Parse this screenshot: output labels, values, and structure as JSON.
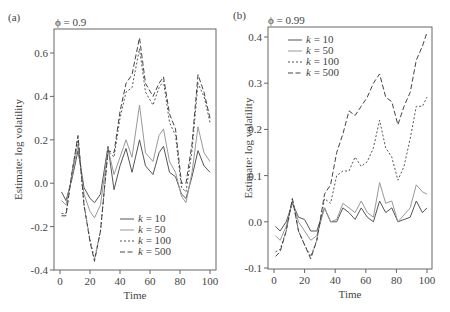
{
  "chart_data": [
    {
      "type": "line",
      "panel_label": "(a)",
      "title": "ϕ = 0.9",
      "xlabel": "Time",
      "ylabel": "Estimate: log volatility",
      "xlim": [
        0,
        100
      ],
      "ylim": [
        -0.4,
        0.7
      ],
      "xticks": [
        0,
        20,
        40,
        60,
        80,
        100
      ],
      "yticks": [
        -0.4,
        -0.2,
        0.0,
        0.2,
        0.4,
        0.6
      ],
      "ytick_labels": [
        "-0.4",
        "-0.2",
        "0.0",
        "0.2",
        "0.4",
        "0.6"
      ],
      "legend_position": "lower center",
      "x": [
        1,
        4,
        8,
        12,
        16,
        20,
        23,
        27,
        32,
        36,
        40,
        44,
        48,
        53,
        57,
        62,
        66,
        69,
        73,
        77,
        81,
        84,
        88,
        92,
        96,
        100
      ],
      "series": [
        {
          "name": "k = 10",
          "style": "solid",
          "values": [
            -0.04,
            -0.08,
            0.02,
            0.15,
            -0.02,
            -0.07,
            -0.09,
            -0.05,
            0.17,
            -0.03,
            0.08,
            0.16,
            0.05,
            0.2,
            0.08,
            0.04,
            0.14,
            0.17,
            0.05,
            0.03,
            -0.05,
            -0.07,
            0.03,
            0.15,
            0.08,
            0.05
          ]
        },
        {
          "name": "k = 50",
          "style": "dotted-light",
          "values": [
            -0.08,
            -0.1,
            0.03,
            0.18,
            -0.05,
            -0.13,
            -0.16,
            -0.1,
            0.16,
            0.04,
            0.12,
            0.2,
            0.12,
            0.36,
            0.14,
            0.1,
            0.22,
            0.25,
            0.1,
            0.05,
            -0.06,
            -0.09,
            0.05,
            0.26,
            0.14,
            0.1
          ]
        },
        {
          "name": "k = 100",
          "style": "dashed-short",
          "values": [
            -0.14,
            -0.14,
            0.05,
            0.21,
            -0.1,
            -0.26,
            -0.35,
            -0.22,
            0.15,
            0.12,
            0.3,
            0.42,
            0.44,
            0.62,
            0.42,
            0.36,
            0.44,
            0.47,
            0.28,
            0.22,
            -0.02,
            -0.04,
            0.15,
            0.46,
            0.4,
            0.28
          ]
        },
        {
          "name": "k = 500",
          "style": "dashed-long",
          "values": [
            -0.15,
            -0.15,
            0.05,
            0.22,
            -0.1,
            -0.27,
            -0.36,
            -0.22,
            0.15,
            0.14,
            0.33,
            0.46,
            0.5,
            0.67,
            0.46,
            0.4,
            0.46,
            0.49,
            0.32,
            0.25,
            0.0,
            0.0,
            0.18,
            0.5,
            0.42,
            0.3
          ]
        }
      ]
    },
    {
      "type": "line",
      "panel_label": "(b)",
      "title": "ϕ = 0.99",
      "xlabel": "Time",
      "ylabel": "Estimate: log volatility",
      "xlim": [
        0,
        100
      ],
      "ylim": [
        -0.1,
        0.42
      ],
      "xticks": [
        0,
        20,
        40,
        60,
        80,
        100
      ],
      "yticks": [
        -0.1,
        0.0,
        0.1,
        0.2,
        0.3,
        0.4
      ],
      "ytick_labels": [
        "-0.1",
        "0.0",
        "0.1",
        "0.2",
        "0.3",
        "0.4"
      ],
      "legend_position": "upper left",
      "x": [
        1,
        4,
        8,
        12,
        16,
        20,
        24,
        28,
        33,
        37,
        41,
        45,
        49,
        53,
        57,
        61,
        65,
        69,
        73,
        77,
        81,
        85,
        89,
        93,
        97,
        100
      ],
      "series": [
        {
          "name": "k = 10",
          "style": "solid",
          "values": [
            -0.01,
            -0.02,
            0.0,
            0.04,
            0.01,
            0.005,
            -0.02,
            -0.02,
            0.03,
            0.0,
            0.0,
            0.03,
            0.02,
            0.005,
            0.03,
            0.01,
            0.0,
            0.045,
            0.02,
            0.03,
            0.0,
            0.005,
            0.01,
            0.045,
            0.02,
            0.03
          ]
        },
        {
          "name": "k = 50",
          "style": "dotted-light",
          "values": [
            -0.03,
            -0.04,
            -0.01,
            0.045,
            0.0,
            -0.02,
            -0.04,
            -0.03,
            0.03,
            0.0,
            0.005,
            0.04,
            0.03,
            0.02,
            0.045,
            0.02,
            0.01,
            0.085,
            0.04,
            0.045,
            0.0,
            0.015,
            0.03,
            0.08,
            0.065,
            0.06
          ]
        },
        {
          "name": "k = 100",
          "style": "dashed-short",
          "values": [
            -0.065,
            -0.06,
            -0.02,
            0.05,
            -0.02,
            -0.05,
            -0.075,
            -0.04,
            0.05,
            0.04,
            0.1,
            0.11,
            0.11,
            0.14,
            0.12,
            0.13,
            0.16,
            0.22,
            0.16,
            0.14,
            0.09,
            0.12,
            0.18,
            0.25,
            0.25,
            0.27
          ]
        },
        {
          "name": "k = 500",
          "style": "dashed-long",
          "values": [
            -0.075,
            -0.065,
            -0.02,
            0.05,
            -0.02,
            -0.05,
            -0.08,
            -0.04,
            0.06,
            0.08,
            0.15,
            0.19,
            0.24,
            0.23,
            0.25,
            0.27,
            0.3,
            0.32,
            0.27,
            0.26,
            0.21,
            0.25,
            0.28,
            0.35,
            0.38,
            0.41
          ]
        }
      ]
    }
  ]
}
